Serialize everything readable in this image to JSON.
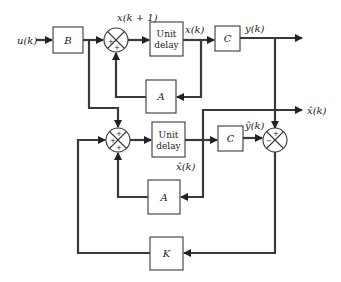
{
  "diagram": {
    "type": "block-diagram",
    "signals": {
      "input": "u(k)",
      "next_state": "x(k + 1)",
      "state": "x(k)",
      "output": "y(k)",
      "estimated_state_out": "x̂(k)",
      "estimated_state": "x̂(k)",
      "estimated_output": "ŷ(k)"
    },
    "blocks": {
      "input_gain": "B",
      "plant_delay_line1": "Unit",
      "plant_delay_line2": "delay",
      "plant_output": "C",
      "plant_feedback": "A",
      "observer_delay_line1": "Unit",
      "observer_delay_line2": "delay",
      "observer_output": "C",
      "observer_feedback": "A",
      "observer_gain": "K"
    },
    "summers": {
      "plant_sum_signs": [
        "+",
        "+"
      ],
      "observer_sum_signs": [
        "+",
        "+",
        "+"
      ],
      "error_sum_signs": [
        "+",
        "−"
      ]
    },
    "colors": {
      "line": "#3a3a3a",
      "block_border": "#3a3a3a",
      "background": "#ffffff"
    }
  }
}
